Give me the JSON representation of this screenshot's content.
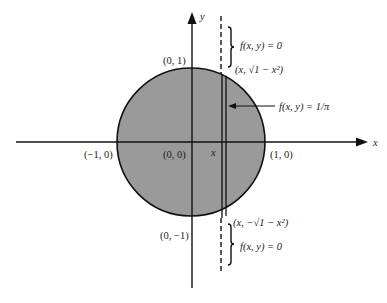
{
  "diagram": {
    "colors": {
      "disk_fill": "#9a9a9a",
      "stroke": "#111111",
      "background": "#ffffff"
    },
    "axes": {
      "x_label": "x",
      "y_label": "y"
    },
    "points": {
      "top": "(0, 1)",
      "bottom": "(0, −1)",
      "left": "(−1, 0)",
      "right": "(1, 0)",
      "origin": "(0, 0)",
      "x_marker": "x"
    },
    "annotations": {
      "upper_zero": "f(x, y) = 0",
      "upper_point": "(x, √1 − x²)",
      "inside": "f(x, y) = 1/π",
      "lower_point": "(x, −√1 − x²)",
      "lower_zero": "f(x, y) = 0"
    }
  }
}
